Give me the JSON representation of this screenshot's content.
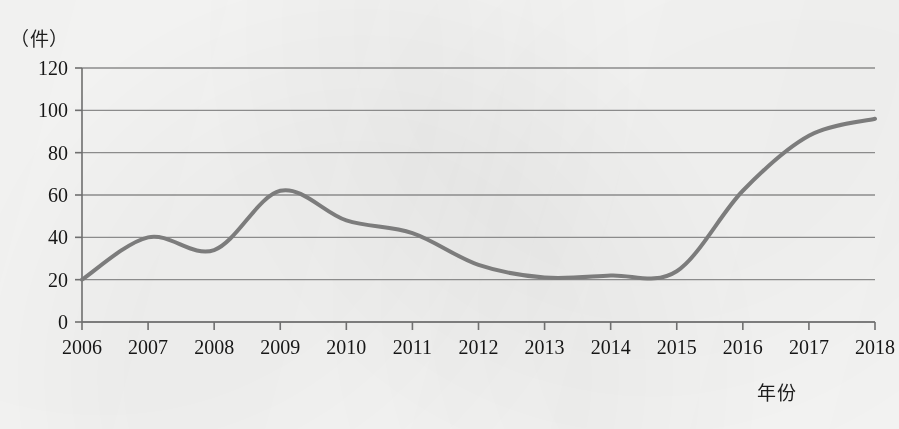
{
  "chart_data": {
    "type": "line",
    "title": "",
    "subtitle": "",
    "xlabel": "年份",
    "ylabel": "（件）",
    "unit_label": "（件）",
    "x": [
      2006,
      2007,
      2008,
      2009,
      2010,
      2011,
      2012,
      2013,
      2014,
      2015,
      2016,
      2017,
      2018
    ],
    "categories": [
      "2006",
      "2007",
      "2008",
      "2009",
      "2010",
      "2011",
      "2012",
      "2013",
      "2014",
      "2015",
      "2016",
      "2017",
      "2018"
    ],
    "values": [
      20,
      40,
      34,
      62,
      48,
      42,
      27,
      21,
      22,
      24,
      62,
      88,
      96
    ],
    "series": [
      {
        "name": "件数",
        "values": [
          20,
          40,
          34,
          62,
          48,
          42,
          27,
          21,
          22,
          24,
          62,
          88,
          96
        ],
        "color": "#7c7c7c",
        "line_width": 4,
        "smooth": true,
        "markers": false
      }
    ],
    "xlim": [
      2006,
      2018
    ],
    "ylim": [
      0,
      120
    ],
    "ytick_values": [
      0,
      20,
      40,
      60,
      80,
      100,
      120
    ],
    "ytick_labels": [
      "0",
      "20",
      "40",
      "60",
      "80",
      "100",
      "120"
    ],
    "xtick_labels": [
      "2006",
      "2007",
      "2008",
      "2009",
      "2010",
      "2011",
      "2012",
      "2013",
      "2014",
      "2015",
      "2016",
      "2017",
      "2018"
    ],
    "grid": {
      "horizontal": true,
      "vertical": false,
      "color": "#8b8b8b"
    },
    "legend": {
      "visible": false,
      "position": "none",
      "entries": []
    },
    "axis": {
      "y_axis_line": true,
      "x_axis_line": true,
      "tick_marks": "outward",
      "axis_color": "#6f6f6f"
    },
    "annotations": []
  }
}
